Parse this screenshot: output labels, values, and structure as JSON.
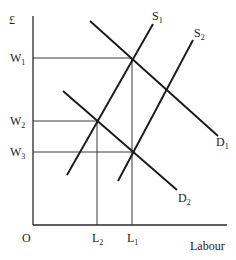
{
  "diagram": {
    "y_axis_label": "£",
    "x_axis_label": "Labour",
    "origin_label": "O",
    "wage_levels": [
      {
        "id": "W1",
        "base": "W",
        "sub": "1"
      },
      {
        "id": "W2",
        "base": "W",
        "sub": "2"
      },
      {
        "id": "W3",
        "base": "W",
        "sub": "3"
      }
    ],
    "quantity_levels": [
      {
        "id": "L2",
        "base": "L",
        "sub": "2"
      },
      {
        "id": "L1",
        "base": "L",
        "sub": "1"
      }
    ],
    "curves": [
      {
        "id": "S1",
        "base": "S",
        "sub": "1",
        "type": "supply"
      },
      {
        "id": "S2",
        "base": "S",
        "sub": "2",
        "type": "supply"
      },
      {
        "id": "D1",
        "base": "D",
        "sub": "1",
        "type": "demand"
      },
      {
        "id": "D2",
        "base": "D",
        "sub": "2",
        "type": "demand"
      }
    ],
    "equilibria": [
      {
        "curves": [
          "S1",
          "D1"
        ],
        "wage": "W1",
        "quantity": "L1"
      },
      {
        "curves": [
          "S1",
          "D2"
        ],
        "wage": "W2",
        "quantity": "L2"
      },
      {
        "curves": [
          "S2",
          "D2"
        ],
        "wage": "W3",
        "quantity": "L1"
      }
    ]
  }
}
